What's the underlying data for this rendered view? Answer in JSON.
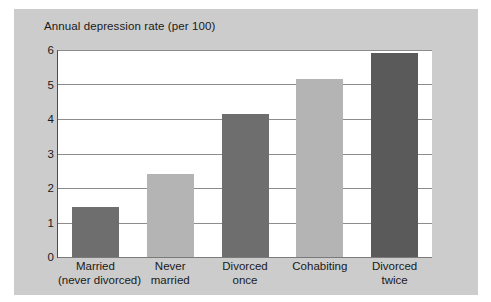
{
  "figure": {
    "background_color": "#ffffff",
    "panel_color": "#cccccc",
    "plot_background": "#ffffff"
  },
  "chart_data": {
    "type": "bar",
    "title": "Annual depression rate (per 100)",
    "xlabel": "",
    "ylabel": "",
    "ylim": [
      0,
      6
    ],
    "yticks": [
      "0",
      "1",
      "2",
      "3",
      "4",
      "5",
      "6"
    ],
    "grid": true,
    "legend": "none",
    "categories": [
      "Married (never divorced)",
      "Never married",
      "Divorced once",
      "Cohabiting",
      "Divorced twice"
    ],
    "category_lines": [
      [
        "Married",
        "(never divorced)"
      ],
      [
        "Never",
        "married"
      ],
      [
        "Divorced",
        "once"
      ],
      [
        "Cohabiting",
        ""
      ],
      [
        "Divorced",
        "twice"
      ]
    ],
    "values": [
      1.45,
      2.4,
      4.15,
      5.15,
      5.9
    ],
    "bar_colors": [
      "#6e6e6e",
      "#b4b4b4",
      "#6e6e6e",
      "#b4b4b4",
      "#5a5a5a"
    ],
    "colors": {
      "dark_bar": "#6e6e6e",
      "light_bar": "#b4b4b4",
      "darkest_bar": "#5a5a5a",
      "gridline": "#8c8c8c",
      "axis": "#4d4d4d",
      "text": "#1a1a1a"
    }
  }
}
